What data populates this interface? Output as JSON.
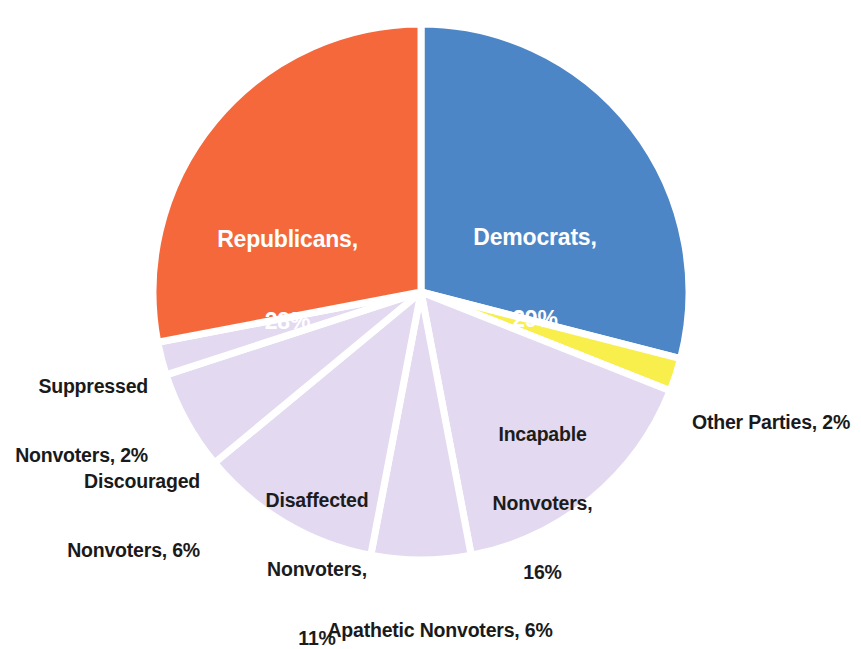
{
  "chart_data": {
    "type": "pie",
    "title": "",
    "subtitle": "",
    "xlabel": "",
    "ylabel": "",
    "legend_position": "none",
    "grid": false,
    "units": "percent",
    "total": 100,
    "start_angle_deg": 0,
    "direction": "clockwise",
    "categories": [
      "Democrats",
      "Other Parties",
      "Incapable Nonvoters",
      "Apathetic Nonvoters",
      "Disaffected Nonvoters",
      "Discouraged Nonvoters",
      "Suppressed Nonvoters",
      "Republicans"
    ],
    "values": [
      29,
      2,
      16,
      6,
      11,
      6,
      2,
      28
    ],
    "colors": [
      "#4d86c6",
      "#f8ee4c",
      "#e3d9f1",
      "#e3d9f1",
      "#e3d9f1",
      "#e3d9f1",
      "#e3d9f1",
      "#f4683c"
    ],
    "slice_separator_color": "#ffffff",
    "slices": [
      {
        "name": "Democrats",
        "value": 29,
        "color": "#4d86c6",
        "label_line1": "Democrats,",
        "label_line2": "29%",
        "label_full": "Democrats, 29%",
        "label_placement": "inside",
        "label_color": "#ffffff"
      },
      {
        "name": "Other Parties",
        "value": 2,
        "color": "#f8ee4c",
        "label_line1": "Other Parties, 2%",
        "label_line2": "",
        "label_full": "Other Parties, 2%",
        "label_placement": "outside-right",
        "label_color": "#1a1a1a"
      },
      {
        "name": "Incapable Nonvoters",
        "value": 16,
        "color": "#e3d9f1",
        "label_line1": "Incapable",
        "label_line2": "Nonvoters,",
        "label_line3": "16%",
        "label_full": "Incapable Nonvoters, 16%",
        "label_placement": "inside",
        "label_color": "#1c1c1c"
      },
      {
        "name": "Apathetic Nonvoters",
        "value": 6,
        "color": "#e3d9f1",
        "label_line1": "Apathetic Nonvoters, 6%",
        "label_line2": "",
        "label_full": "Apathetic Nonvoters, 6%",
        "label_placement": "outside-bottom",
        "label_color": "#1a1a1a"
      },
      {
        "name": "Disaffected Nonvoters",
        "value": 11,
        "color": "#e3d9f1",
        "label_line1": "Disaffected",
        "label_line2": "Nonvoters,",
        "label_line3": "11%",
        "label_full": "Disaffected Nonvoters, 11%",
        "label_placement": "inside",
        "label_color": "#1c1c1c"
      },
      {
        "name": "Discouraged Nonvoters",
        "value": 6,
        "color": "#e3d9f1",
        "label_line1": "Discouraged",
        "label_line2": "Nonvoters, 6%",
        "label_full": "Discouraged Nonvoters, 6%",
        "label_placement": "outside-left",
        "label_color": "#1a1a1a"
      },
      {
        "name": "Suppressed Nonvoters",
        "value": 2,
        "color": "#e3d9f1",
        "label_line1": "Suppressed",
        "label_line2": "Nonvoters, 2%",
        "label_full": "Suppressed Nonvoters, 2%",
        "label_placement": "outside-left",
        "label_color": "#1a1a1a"
      },
      {
        "name": "Republicans",
        "value": 28,
        "color": "#f4683c",
        "label_line1": "Republicans,",
        "label_line2": "28%",
        "label_full": "Republicans, 28%",
        "label_placement": "inside",
        "label_color": "#ffffff"
      }
    ]
  },
  "labels": {
    "democrats": {
      "line1": "Democrats,",
      "line2": "29%"
    },
    "republicans": {
      "line1": "Republicans,",
      "line2": "28%"
    },
    "other_parties": {
      "line1": "Other Parties, 2%"
    },
    "incapable": {
      "line1": "Incapable",
      "line2": "Nonvoters,",
      "line3": "16%"
    },
    "apathetic": {
      "line1": "Apathetic Nonvoters, 6%"
    },
    "disaffected": {
      "line1": "Disaffected",
      "line2": "Nonvoters,",
      "line3": "11%"
    },
    "discouraged": {
      "line1": "Discouraged",
      "line2": "Nonvoters, 6%"
    },
    "suppressed": {
      "line1": "Suppressed",
      "line2": "Nonvoters, 2%"
    }
  }
}
